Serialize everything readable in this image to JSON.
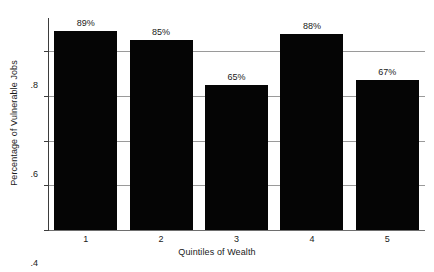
{
  "chart_data": {
    "type": "bar",
    "title": "",
    "xlabel": "Quintiles of Wealth",
    "ylabel": "Percentage of Vulnerable Jobs",
    "categories": [
      "1",
      "2",
      "3",
      "4",
      "5"
    ],
    "values": [
      0.89,
      0.85,
      0.65,
      0.88,
      0.67
    ],
    "data_labels": [
      "89%",
      "85%",
      "65%",
      "88%",
      "67%"
    ],
    "ylim": [
      0,
      0.95
    ],
    "ytick_values": [
      0,
      0.2,
      0.4,
      0.6,
      0.8
    ],
    "ytick_labels": [
      "0",
      ".2",
      ".4",
      ".6",
      ".8"
    ],
    "xtick_labels": [
      "1",
      "2",
      "3",
      "4",
      "5"
    ],
    "grid": "horizontal",
    "legend": "none",
    "bar_color": "#050505",
    "grid_color": "#9a9a9a",
    "axis_color": "#3d3d3d",
    "background_color": "#ffffff",
    "text_color": "#1a1a1a"
  }
}
